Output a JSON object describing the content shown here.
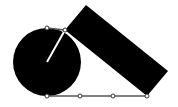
{
  "diagram": {
    "type": "geometry",
    "colors": {
      "fill": "#000000",
      "background": "#ffffff",
      "radius_line": "#ffffff",
      "point_stroke": "#333333"
    },
    "circle": {
      "cx": 47,
      "cy": 62,
      "r": 34
    },
    "radius_line": {
      "x1": 47,
      "y1": 62,
      "x2": 65,
      "y2": 30
    },
    "rectangle": {
      "points": [
        [
          86,
          5
        ],
        [
          168,
          71
        ],
        [
          147,
          96
        ],
        [
          65,
          30
        ]
      ]
    },
    "top_tangent": {
      "x1": 47,
      "y1": 28,
      "x2": 65,
      "y2": 30
    },
    "bottom_line": {
      "x1": 47,
      "y1": 96,
      "x2": 147,
      "y2": 96
    },
    "points": [
      {
        "x": 47,
        "y": 28
      },
      {
        "x": 65,
        "y": 30
      },
      {
        "x": 47,
        "y": 96
      },
      {
        "x": 80,
        "y": 96
      },
      {
        "x": 113,
        "y": 96
      },
      {
        "x": 147,
        "y": 96
      }
    ]
  }
}
